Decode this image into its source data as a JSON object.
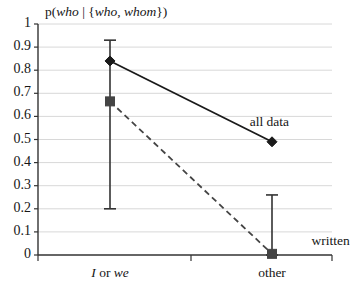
{
  "chart_data": {
    "type": "line",
    "title": "p(who | {who, whom})",
    "title_parts": [
      {
        "text": "p(",
        "italic": false
      },
      {
        "text": "who",
        "italic": true
      },
      {
        "text": " | {",
        "italic": false
      },
      {
        "text": "who",
        "italic": true
      },
      {
        "text": ", ",
        "italic": false
      },
      {
        "text": "whom",
        "italic": true
      },
      {
        "text": "})",
        "italic": false
      }
    ],
    "xlabel": "",
    "ylabel": "",
    "categories": [
      "I or we",
      "other"
    ],
    "category_parts": [
      [
        {
          "text": "I",
          "italic": true
        },
        {
          "text": " or ",
          "italic": false
        },
        {
          "text": "we",
          "italic": true
        }
      ],
      [
        {
          "text": "other",
          "italic": false
        }
      ]
    ],
    "ylim": [
      0,
      1
    ],
    "ytick_labels": [
      "1",
      "0.9",
      "0.8",
      "0.7",
      "0.6",
      "0.5",
      "0.4",
      "0.3",
      "0.2",
      "0.1",
      "0"
    ],
    "ytick_values": [
      1,
      0.9,
      0.8,
      0.7,
      0.6,
      0.5,
      0.4,
      0.3,
      0.2,
      0.1,
      0
    ],
    "grid": true,
    "grid_color": "#d8d8d8",
    "legend_position": "inline-annotation",
    "series": [
      {
        "name": "all data",
        "label": "all data",
        "style": "solid",
        "marker": "diamond",
        "color": "#1a1a1a",
        "values": [
          0.84,
          0.49
        ],
        "errors": [
          null,
          null
        ]
      },
      {
        "name": "written",
        "label": "written",
        "style": "dashed",
        "marker": "square",
        "color": "#444444",
        "values": [
          0.665,
          0.005
        ],
        "errors": [
          {
            "low": 0.2,
            "high": 0.93
          },
          {
            "low": 0.0,
            "high": 0.26
          }
        ]
      }
    ],
    "annotations": [
      {
        "text": "all data",
        "x": 0.72,
        "y": 0.57
      },
      {
        "text": "written",
        "x": 0.93,
        "y": 0.055
      }
    ]
  }
}
